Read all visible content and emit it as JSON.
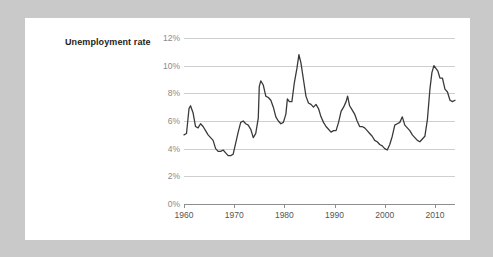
{
  "card": {
    "background": "#ffffff",
    "page_background": "#c9c9c9"
  },
  "chart_data": {
    "type": "line",
    "title": "Unemployment rate",
    "xlabel": "",
    "ylabel": "",
    "grid": true,
    "legend": null,
    "line_color": "#3a3a3a",
    "xlim": [
      1960,
      2014
    ],
    "ylim": [
      0,
      12
    ],
    "ytick_labels": [
      "0%",
      "2%",
      "4%",
      "6%",
      "8%",
      "10%",
      "12%"
    ],
    "ytick_values": [
      0,
      2,
      4,
      6,
      8,
      10,
      12
    ],
    "xtick_labels": [
      "1960",
      "1970",
      "1980",
      "1990",
      "2000",
      "2010"
    ],
    "xtick_values": [
      1960,
      1970,
      1980,
      1990,
      2000,
      2010
    ],
    "x": [
      1960.0,
      1960.5,
      1961.0,
      1961.3,
      1961.8,
      1962.3,
      1962.8,
      1963.3,
      1963.8,
      1964.3,
      1964.8,
      1965.3,
      1965.8,
      1966.3,
      1966.8,
      1967.3,
      1967.8,
      1968.3,
      1968.8,
      1969.3,
      1969.8,
      1970.3,
      1970.8,
      1971.3,
      1971.8,
      1972.3,
      1972.8,
      1973.3,
      1973.8,
      1974.3,
      1974.8,
      1975.0,
      1975.3,
      1975.8,
      1976.3,
      1976.8,
      1977.3,
      1977.8,
      1978.3,
      1978.8,
      1979.3,
      1979.8,
      1980.3,
      1980.6,
      1981.0,
      1981.5,
      1982.0,
      1982.5,
      1982.9,
      1983.3,
      1983.8,
      1984.3,
      1984.8,
      1985.3,
      1985.8,
      1986.3,
      1986.8,
      1987.3,
      1987.8,
      1988.3,
      1988.8,
      1989.3,
      1989.8,
      1990.3,
      1990.8,
      1991.3,
      1991.8,
      1992.3,
      1992.6,
      1993.0,
      1993.5,
      1994.0,
      1994.5,
      1995.0,
      1995.5,
      1996.0,
      1996.5,
      1997.0,
      1997.5,
      1998.0,
      1998.5,
      1999.0,
      1999.5,
      2000.0,
      2000.5,
      2001.0,
      2001.5,
      2002.0,
      2002.5,
      2003.0,
      2003.5,
      2004.0,
      2004.5,
      2005.0,
      2005.5,
      2006.0,
      2006.5,
      2007.0,
      2007.5,
      2008.0,
      2008.5,
      2009.0,
      2009.4,
      2009.8,
      2010.2,
      2010.6,
      2011.0,
      2011.5,
      2012.0,
      2012.5,
      2013.0,
      2013.5,
      2014.0
    ],
    "values": [
      5.0,
      5.1,
      6.9,
      7.1,
      6.6,
      5.6,
      5.5,
      5.8,
      5.6,
      5.3,
      5.0,
      4.8,
      4.6,
      4.0,
      3.8,
      3.8,
      3.9,
      3.7,
      3.5,
      3.5,
      3.6,
      4.4,
      5.2,
      5.9,
      6.0,
      5.8,
      5.7,
      5.4,
      4.8,
      5.1,
      6.2,
      8.5,
      8.9,
      8.6,
      7.8,
      7.7,
      7.5,
      7.0,
      6.3,
      6.0,
      5.8,
      5.9,
      6.5,
      7.6,
      7.4,
      7.4,
      8.8,
      9.8,
      10.8,
      10.2,
      9.0,
      7.8,
      7.3,
      7.2,
      7.0,
      7.2,
      6.9,
      6.3,
      5.9,
      5.6,
      5.4,
      5.2,
      5.3,
      5.3,
      5.9,
      6.7,
      7.0,
      7.4,
      7.8,
      7.1,
      6.8,
      6.5,
      6.0,
      5.6,
      5.6,
      5.5,
      5.3,
      5.1,
      4.9,
      4.6,
      4.5,
      4.3,
      4.2,
      4.0,
      3.9,
      4.3,
      4.9,
      5.7,
      5.8,
      5.9,
      6.3,
      5.7,
      5.5,
      5.3,
      5.0,
      4.8,
      4.6,
      4.5,
      4.7,
      4.9,
      6.1,
      8.3,
      9.5,
      10.0,
      9.8,
      9.6,
      9.1,
      9.1,
      8.3,
      8.1,
      7.5,
      7.4,
      7.5
    ]
  }
}
